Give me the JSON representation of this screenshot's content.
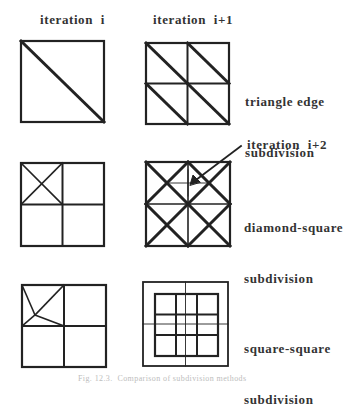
{
  "headers": {
    "col_left": "iteration  i",
    "col_right": "iteration  i+1"
  },
  "rows": [
    {
      "name": "triangle-edge",
      "label_line1": "triangle edge",
      "label_line2": "subdivision"
    },
    {
      "name": "diamond-square",
      "label_line1": "diamond-square",
      "label_line2": "subdivision",
      "annotation": "iteration  i+2"
    },
    {
      "name": "square-square",
      "label_line1": "square-square",
      "label_line2": "subdivision"
    }
  ],
  "caption": "Fig. 12.3.  Comparison of subdivision methods",
  "colors": {
    "line": "#222222",
    "text": "#333333",
    "caption": "#bdbdbd"
  }
}
